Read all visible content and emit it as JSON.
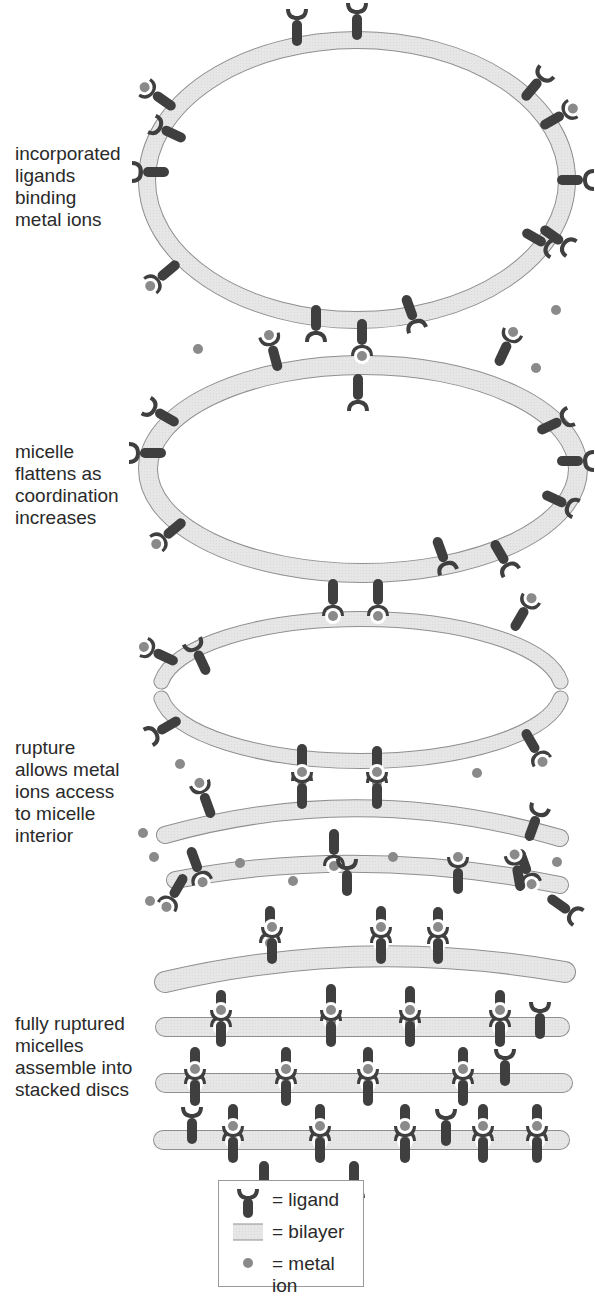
{
  "colors": {
    "ligand": "#3f3f3f",
    "bilayer_fill": "#e6e6e6",
    "bilayer_stroke": "#8f8f8f",
    "metal_ion": "#8a8a8a",
    "text": "#2a2a2a"
  },
  "stages": [
    {
      "id": "stage-1",
      "label": "incorporated\nligands\nbinding\nmetal ions",
      "label_top": 143
    },
    {
      "id": "stage-2",
      "label": "micelle\nflattens as\ncoordination\nincreases",
      "label_top": 441
    },
    {
      "id": "stage-3",
      "label": "rupture\nallows metal\nions access\nto micelle\ninterior",
      "label_top": 737
    },
    {
      "id": "stage-4",
      "label": "fully ruptured\nmicelles\nassemble into\nstacked discs",
      "label_top": 1013
    }
  ],
  "legend": {
    "items": [
      {
        "icon": "ligand-icon",
        "label": "= ligand"
      },
      {
        "icon": "bilayer-icon",
        "label": "= bilayer"
      },
      {
        "icon": "metal-ion-icon",
        "label": "= metal  ion"
      }
    ]
  },
  "scene": {
    "ellipses": [
      {
        "name": "micelle-1-bilayer",
        "cx": 357,
        "cy": 180,
        "rx": 210,
        "ry": 140,
        "w": 16
      },
      {
        "name": "micelle-2-bilayer",
        "cx": 363,
        "cy": 469,
        "rx": 215,
        "ry": 104,
        "w": 18
      }
    ],
    "ruptured": [
      {
        "name": "micelle-3-bilayer",
        "cx": 361,
        "cy": 690,
        "rx": 201,
        "ry": 71,
        "w": 14
      }
    ],
    "arcs": [
      {
        "name": "micelle-4-top-bilayer",
        "x1": 165,
        "y1": 835,
        "cx": 360,
        "cy": 780,
        "x2": 560,
        "y2": 838,
        "w": 16
      },
      {
        "name": "micelle-4-bottom-bilayer",
        "x1": 175,
        "y1": 880,
        "cx": 360,
        "cy": 845,
        "x2": 560,
        "y2": 885,
        "w": 16
      },
      {
        "name": "disc-1-bilayer",
        "x1": 165,
        "y1": 982,
        "cx": 360,
        "cy": 936,
        "x2": 565,
        "y2": 972,
        "w": 20
      },
      {
        "name": "disc-2-bilayer",
        "x1": 165,
        "y1": 1027,
        "cx": 360,
        "cy": 1027,
        "x2": 560,
        "y2": 1027,
        "w": 18
      },
      {
        "name": "disc-3-bilayer",
        "x1": 165,
        "y1": 1083,
        "cx": 360,
        "cy": 1083,
        "x2": 563,
        "y2": 1083,
        "w": 18
      },
      {
        "name": "disc-4-bilayer",
        "x1": 163,
        "y1": 1140,
        "cx": 360,
        "cy": 1140,
        "x2": 560,
        "y2": 1140,
        "w": 18
      }
    ],
    "ligands": [
      [
        297,
        40,
        0,
        0
      ],
      [
        357,
        34,
        0,
        0
      ],
      [
        170,
        105,
        -55,
        1
      ],
      [
        180,
        137,
        -65,
        0
      ],
      [
        163,
        172,
        -90,
        0
      ],
      [
        527,
        95,
        40,
        0
      ],
      [
        546,
        124,
        60,
        1
      ],
      [
        563,
        180,
        90,
        0
      ],
      [
        528,
        234,
        120,
        0
      ],
      [
        546,
        231,
        125,
        0
      ],
      [
        174,
        266,
        -130,
        1
      ],
      [
        407,
        301,
        160,
        0
      ],
      [
        316,
        311,
        180,
        0
      ],
      [
        362,
        325,
        180,
        1
      ],
      [
        277,
        365,
        -15,
        1
      ],
      [
        358,
        380,
        180,
        0
      ],
      [
        500,
        360,
        25,
        1
      ],
      [
        173,
        421,
        -60,
        0
      ],
      [
        160,
        453,
        -90,
        0
      ],
      [
        180,
        524,
        -130,
        1
      ],
      [
        543,
        429,
        65,
        0
      ],
      [
        563,
        461,
        90,
        0
      ],
      [
        548,
        496,
        115,
        0
      ],
      [
        438,
        543,
        160,
        0
      ],
      [
        496,
        546,
        150,
        0
      ],
      [
        333,
        585,
        180,
        1
      ],
      [
        378,
        585,
        180,
        1
      ],
      [
        172,
        660,
        -65,
        1
      ],
      [
        205,
        669,
        -25,
        0
      ],
      [
        175,
        722,
        -120,
        0
      ],
      [
        516,
        625,
        30,
        1
      ],
      [
        527,
        735,
        150,
        1
      ],
      [
        302,
        750,
        180,
        1
      ],
      [
        377,
        752,
        180,
        1
      ],
      [
        302,
        803,
        0,
        1
      ],
      [
        377,
        803,
        0,
        1
      ],
      [
        210,
        812,
        -20,
        1
      ],
      [
        334,
        835,
        180,
        1
      ],
      [
        192,
        853,
        160,
        1
      ],
      [
        182,
        880,
        -150,
        1
      ],
      [
        530,
        835,
        20,
        0
      ],
      [
        521,
        855,
        160,
        1
      ],
      [
        520,
        885,
        -10,
        1
      ],
      [
        458,
        888,
        0,
        1
      ],
      [
        347,
        890,
        0,
        0
      ],
      [
        553,
        900,
        125,
        0
      ],
      [
        270,
        912,
        180,
        1
      ],
      [
        381,
        912,
        180,
        1
      ],
      [
        438,
        913,
        180,
        1
      ],
      [
        272,
        958,
        0,
        1
      ],
      [
        381,
        958,
        0,
        1
      ],
      [
        438,
        958,
        0,
        1
      ],
      [
        221,
        996,
        180,
        1
      ],
      [
        331,
        990,
        180,
        1
      ],
      [
        410,
        992,
        180,
        1
      ],
      [
        500,
        996,
        180,
        1
      ],
      [
        221,
        1041,
        0,
        1
      ],
      [
        331,
        1041,
        0,
        1
      ],
      [
        410,
        1041,
        0,
        1
      ],
      [
        500,
        1041,
        0,
        1
      ],
      [
        540,
        1033,
        0,
        0
      ],
      [
        195,
        1053,
        180,
        1
      ],
      [
        286,
        1053,
        180,
        1
      ],
      [
        368,
        1053,
        180,
        1
      ],
      [
        463,
        1053,
        180,
        1
      ],
      [
        195,
        1100,
        0,
        1
      ],
      [
        286,
        1100,
        0,
        1
      ],
      [
        368,
        1100,
        0,
        1
      ],
      [
        463,
        1100,
        0,
        1
      ],
      [
        505,
        1080,
        0,
        0
      ],
      [
        233,
        1110,
        180,
        1
      ],
      [
        320,
        1110,
        180,
        1
      ],
      [
        405,
        1110,
        180,
        1
      ],
      [
        483,
        1110,
        180,
        1
      ],
      [
        537,
        1110,
        180,
        1
      ],
      [
        233,
        1157,
        0,
        1
      ],
      [
        320,
        1157,
        0,
        1
      ],
      [
        405,
        1157,
        0,
        1
      ],
      [
        483,
        1157,
        0,
        1
      ],
      [
        537,
        1157,
        0,
        1
      ],
      [
        192,
        1138,
        0,
        0
      ],
      [
        446,
        1140,
        0,
        0
      ],
      [
        264,
        1167,
        180,
        0
      ],
      [
        354,
        1167,
        180,
        0
      ]
    ],
    "free_ions": [
      [
        556,
        310
      ],
      [
        198,
        349
      ],
      [
        536,
        368
      ],
      [
        180,
        764
      ],
      [
        477,
        773
      ],
      [
        143,
        833
      ],
      [
        154,
        857
      ],
      [
        240,
        863
      ],
      [
        293,
        881
      ],
      [
        393,
        857
      ],
      [
        150,
        901
      ],
      [
        557,
        862
      ]
    ]
  }
}
